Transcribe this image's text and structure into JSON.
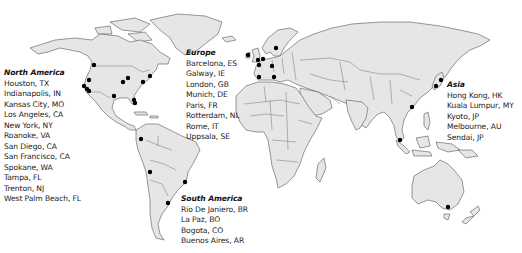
{
  "map": {
    "type": "world-map",
    "land_color": "#e6e6e6",
    "border_color": "#555555",
    "marker_color": "#000000",
    "background": "#ffffff"
  },
  "regions": {
    "north_america": {
      "title": "North America",
      "cities": [
        "Houston, TX",
        "Indianapolis, IN",
        "Kansas City, MO",
        "Los Angeles, CA",
        "New York, NY",
        "Roanoke, VA",
        "San Diego, CA",
        "San Francisco, CA",
        "Spokane, WA",
        "Tampa, FL",
        "Trenton, NJ",
        "West Palm Beach, FL"
      ]
    },
    "europe": {
      "title": "Europe",
      "cities": [
        "Barcelona, ES",
        "Galway, IE",
        "London, GB",
        "Munich, DE",
        "Paris, FR",
        "Rotterdam, NL",
        "Rome, IT",
        "Uppsala, SE"
      ]
    },
    "asia": {
      "title": "Asia",
      "cities": [
        "Hong Kong, HK",
        "Kuala Lumpur, MY",
        "Kyoto, JP",
        "Melbourne, AU",
        "Sendai, JP"
      ]
    },
    "south_america": {
      "title": "South America",
      "cities": [
        "Rio De Janiero, BR",
        "La Paz, BO",
        "Bogota, CO",
        "Buenos Aires, AR"
      ]
    }
  },
  "markers": [
    {
      "city": "Spokane, WA",
      "x": 94,
      "y": 65
    },
    {
      "city": "San Francisco, CA",
      "x": 84,
      "y": 85
    },
    {
      "city": "Los Angeles, CA",
      "x": 86,
      "y": 89
    },
    {
      "city": "San Diego, CA",
      "x": 88,
      "y": 91
    },
    {
      "city": "Kansas City, MO",
      "x": 89,
      "y": 80
    },
    {
      "city": "Houston, TX",
      "x": 114,
      "y": 96
    },
    {
      "city": "Indianapolis, IN",
      "x": 127,
      "y": 78
    },
    {
      "city": "Roanoke, VA",
      "x": 123,
      "y": 82
    },
    {
      "city": "New York, NY",
      "x": 150,
      "y": 76
    },
    {
      "city": "Trenton, NJ",
      "x": 143,
      "y": 81
    },
    {
      "city": "Tampa, FL",
      "x": 134,
      "y": 100
    },
    {
      "city": "West Palm Beach, FL",
      "x": 135,
      "y": 103
    },
    {
      "city": "Bogota, CO",
      "x": 141,
      "y": 139
    },
    {
      "city": "La Paz, BO",
      "x": 150,
      "y": 172
    },
    {
      "city": "Rio De Janiero, BR",
      "x": 185,
      "y": 182
    },
    {
      "city": "Buenos Aires, AR",
      "x": 168,
      "y": 203
    },
    {
      "city": "Galway, IE",
      "x": 248,
      "y": 55
    },
    {
      "city": "London, GB",
      "x": 258,
      "y": 60
    },
    {
      "city": "Rotterdam, NL",
      "x": 263,
      "y": 59
    },
    {
      "city": "Paris, FR",
      "x": 259,
      "y": 64
    },
    {
      "city": "Uppsala, SE",
      "x": 276,
      "y": 48
    },
    {
      "city": "Munich, DE",
      "x": 272,
      "y": 66
    },
    {
      "city": "Barcelona, ES",
      "x": 259,
      "y": 77
    },
    {
      "city": "Rome, IT",
      "x": 274,
      "y": 77
    },
    {
      "city": "Hong Kong, HK",
      "x": 412,
      "y": 107
    },
    {
      "city": "Kuala Lumpur, MY",
      "x": 400,
      "y": 140
    },
    {
      "city": "Kyoto, JP",
      "x": 437,
      "y": 86
    },
    {
      "city": "Sendai, JP",
      "x": 441,
      "y": 80
    },
    {
      "city": "Melbourne, AU",
      "x": 448,
      "y": 207
    }
  ]
}
